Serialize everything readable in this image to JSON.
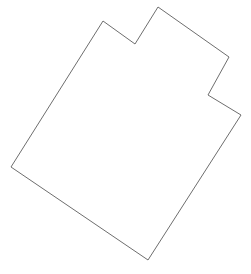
{
  "canvas": {
    "width": 251,
    "height": 274,
    "background_color": "#ffffff"
  },
  "figure": {
    "name": "irregular-polygon-outline",
    "stroke_color": "#6e6e6e",
    "fill_color": "#ffffff",
    "stroke_width": 1,
    "closed": true,
    "vertex_count": 8,
    "points": "103,21 135,44 158,7 229,57 208,95 241,115 148,260 11,167",
    "vertices": [
      {
        "label": "top-left-peak",
        "x": 103,
        "y": 21
      },
      {
        "label": "top-notch-valley",
        "x": 135,
        "y": 44
      },
      {
        "label": "top-right-peak",
        "x": 158,
        "y": 7
      },
      {
        "label": "right-upper-corner",
        "x": 229,
        "y": 57
      },
      {
        "label": "right-notch-inner",
        "x": 208,
        "y": 95
      },
      {
        "label": "right-outer-corner",
        "x": 241,
        "y": 115
      },
      {
        "label": "bottom-corner",
        "x": 148,
        "y": 260
      },
      {
        "label": "left-corner",
        "x": 11,
        "y": 167
      }
    ]
  }
}
